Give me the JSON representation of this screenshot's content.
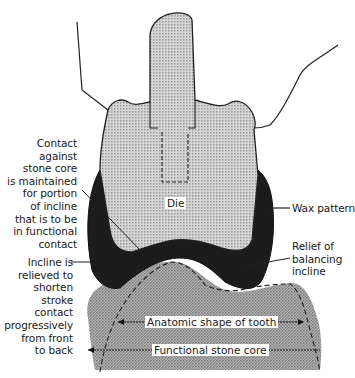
{
  "figure": {
    "type": "dental cross-section diagram",
    "colors": {
      "die_fill": "#c8c8c8",
      "wax_pattern": "#1c1c1c",
      "stone_core_fill": "#a9a9a9",
      "outline": "#222222",
      "background": "#ffffff"
    }
  },
  "labels": {
    "die": "Die",
    "wax_pattern": "Wax pattern",
    "relief": [
      "Relief of",
      "balancing",
      "incline"
    ],
    "contact": [
      "Contact against",
      "stone core",
      "is maintained",
      "for portion",
      "of incline",
      "that is to be",
      "in functional",
      "contact"
    ],
    "incline": [
      "Incline is",
      "relieved to",
      "shorten stroke",
      "contact",
      "progressively",
      "from front",
      "to back"
    ],
    "anatomic_shape": "Anatomic shape of tooth",
    "functional_core": "Functional stone core"
  }
}
